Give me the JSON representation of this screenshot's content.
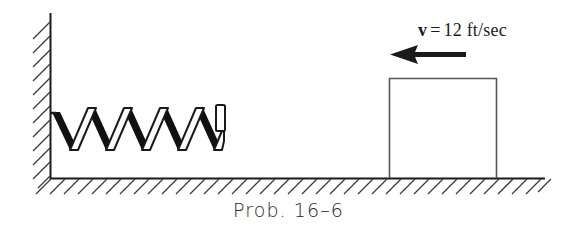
{
  "figure": {
    "caption": "Prob. 16–6",
    "velocity_label": {
      "symbol": "v",
      "equals": "=",
      "value": "12 ft/sec",
      "full_text": "v = 12 ft/sec"
    },
    "colors": {
      "line": "#1a1a1a",
      "spring_fill": "#111111",
      "hatch": "#3a3a3a",
      "background": "#ffffff",
      "block_outline": "#555555"
    },
    "elements": {
      "wall_name": "fixed vertical wall",
      "ground_name": "ground surface",
      "spring_name": "coil spring",
      "block_name": "sliding block",
      "arrow_name": "velocity arrow pointing left"
    },
    "geometry": {
      "wall_x": 50,
      "wall_top_y": 13,
      "ground_y": 178,
      "ground_left_x": 50,
      "ground_right_x": 545,
      "spring_left_x": 50,
      "spring_right_x": 225,
      "spring_top_y": 106,
      "spring_bottom_y": 152,
      "spring_cycles": 5,
      "block_left_x": 389,
      "block_right_x": 497,
      "block_top_y": 78,
      "arrow_tip_x": 390,
      "arrow_tail_x": 466,
      "arrow_y": 54
    }
  }
}
